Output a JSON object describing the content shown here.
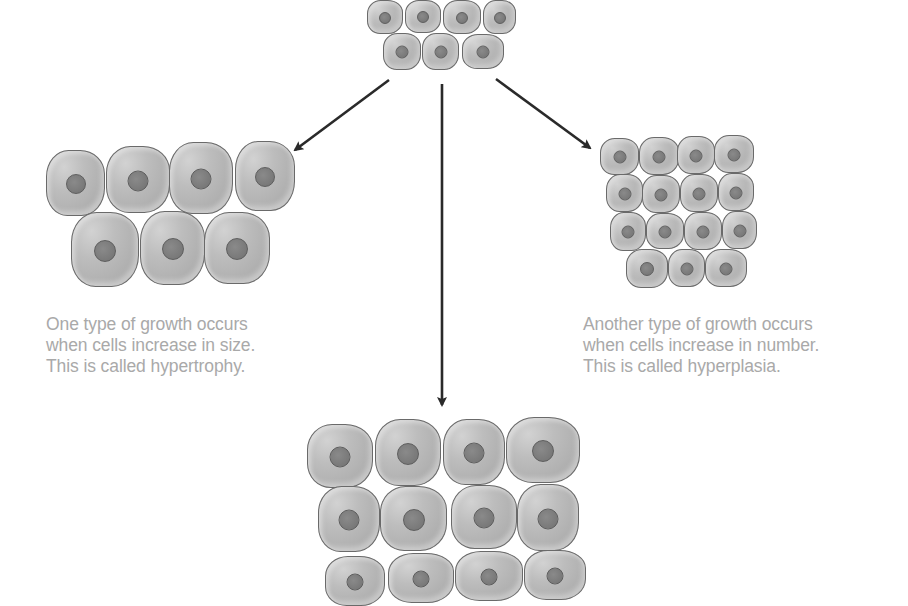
{
  "diagram": {
    "original_group": {
      "label": "original-cells",
      "rows": [
        {
          "cells": [
            {
              "x": 367,
              "y": 0,
              "w": 36,
              "h": 34
            },
            {
              "x": 405,
              "y": 0,
              "w": 36,
              "h": 33
            },
            {
              "x": 443,
              "y": 0,
              "w": 38,
              "h": 34
            },
            {
              "x": 483,
              "y": 0,
              "w": 33,
              "h": 34
            }
          ]
        },
        {
          "cells": [
            {
              "x": 383,
              "y": 33,
              "w": 38,
              "h": 37
            },
            {
              "x": 422,
              "y": 33,
              "w": 37,
              "h": 37
            },
            {
              "x": 462,
              "y": 34,
              "w": 42,
              "h": 35
            }
          ]
        }
      ]
    },
    "hypertrophy_group": {
      "label": "hypertrophy-cells",
      "rows": [
        {
          "cells": [
            {
              "x": 46,
              "y": 150,
              "w": 59,
              "h": 66
            },
            {
              "x": 106,
              "y": 146,
              "w": 64,
              "h": 67
            },
            {
              "x": 169,
              "y": 142,
              "w": 64,
              "h": 72
            },
            {
              "x": 235,
              "y": 141,
              "w": 60,
              "h": 70
            }
          ]
        },
        {
          "cells": [
            {
              "x": 71,
              "y": 212,
              "w": 68,
              "h": 75
            },
            {
              "x": 140,
              "y": 211,
              "w": 65,
              "h": 74
            },
            {
              "x": 204,
              "y": 212,
              "w": 66,
              "h": 72
            }
          ]
        }
      ]
    },
    "hyperplasia_group": {
      "label": "hyperplasia-cells",
      "rows": [
        {
          "cells": [
            {
              "x": 600,
              "y": 138,
              "w": 39,
              "h": 37
            },
            {
              "x": 639,
              "y": 137,
              "w": 40,
              "h": 38
            },
            {
              "x": 677,
              "y": 136,
              "w": 38,
              "h": 38
            },
            {
              "x": 714,
              "y": 135,
              "w": 40,
              "h": 38
            }
          ]
        },
        {
          "cells": [
            {
              "x": 606,
              "y": 174,
              "w": 37,
              "h": 38
            },
            {
              "x": 642,
              "y": 175,
              "w": 38,
              "h": 38
            },
            {
              "x": 680,
              "y": 174,
              "w": 38,
              "h": 38
            },
            {
              "x": 718,
              "y": 173,
              "w": 36,
              "h": 38
            }
          ]
        },
        {
          "cells": [
            {
              "x": 610,
              "y": 212,
              "w": 36,
              "h": 39
            },
            {
              "x": 646,
              "y": 213,
              "w": 38,
              "h": 36
            },
            {
              "x": 684,
              "y": 212,
              "w": 38,
              "h": 38
            },
            {
              "x": 722,
              "y": 211,
              "w": 35,
              "h": 38
            }
          ]
        },
        {
          "cells": [
            {
              "x": 626,
              "y": 249,
              "w": 42,
              "h": 39
            },
            {
              "x": 668,
              "y": 249,
              "w": 37,
              "h": 38
            },
            {
              "x": 705,
              "y": 249,
              "w": 42,
              "h": 38
            }
          ]
        }
      ]
    },
    "combined_group": {
      "label": "combined-growth-cells",
      "rows": [
        {
          "cells": [
            {
              "x": 307,
              "y": 424,
              "w": 66,
              "h": 64
            },
            {
              "x": 375,
              "y": 419,
              "w": 66,
              "h": 67
            },
            {
              "x": 443,
              "y": 419,
              "w": 62,
              "h": 66
            },
            {
              "x": 506,
              "y": 417,
              "w": 74,
              "h": 66
            }
          ]
        },
        {
          "cells": [
            {
              "x": 318,
              "y": 486,
              "w": 62,
              "h": 66
            },
            {
              "x": 380,
              "y": 486,
              "w": 67,
              "h": 65
            },
            {
              "x": 451,
              "y": 485,
              "w": 66,
              "h": 64
            },
            {
              "x": 517,
              "y": 484,
              "w": 62,
              "h": 67
            }
          ]
        },
        {
          "cells": [
            {
              "x": 325,
              "y": 556,
              "w": 60,
              "h": 50
            },
            {
              "x": 388,
              "y": 553,
              "w": 66,
              "h": 50
            },
            {
              "x": 455,
              "y": 551,
              "w": 68,
              "h": 50
            },
            {
              "x": 524,
              "y": 550,
              "w": 62,
              "h": 50
            }
          ]
        }
      ]
    },
    "arrows": [
      {
        "name": "arrow-to-hypertrophy",
        "x1": 389,
        "y1": 80,
        "x2": 295,
        "y2": 150
      },
      {
        "name": "arrow-to-combined",
        "x1": 442,
        "y1": 84,
        "x2": 442,
        "y2": 405
      },
      {
        "name": "arrow-to-hyperplasia",
        "x1": 496,
        "y1": 79,
        "x2": 590,
        "y2": 148
      }
    ],
    "arrow_color": "#2a2a2a",
    "captions": {
      "hypertrophy": {
        "lines": [
          "One type of growth occurs",
          "when cells increase in size.",
          "This is called hypertrophy."
        ]
      },
      "hyperplasia": {
        "lines": [
          "Another type of growth occurs",
          "when cells increase in number.",
          "This is called hyperplasia."
        ]
      }
    }
  }
}
